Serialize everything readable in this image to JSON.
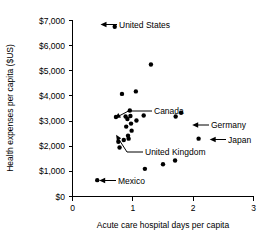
{
  "chart_data": {
    "type": "scatter",
    "title": "",
    "xlabel": "Acute care hospital days per capita",
    "ylabel": "Health expenses per capita ($US)",
    "xlim": [
      0,
      3
    ],
    "ylim": [
      0,
      7000
    ],
    "grid": false,
    "legend": "none",
    "xticks": [
      "0",
      "1",
      "2",
      "3"
    ],
    "xtick_values": [
      0,
      1,
      2,
      3
    ],
    "yticks": [
      "$0",
      "$1,000",
      "$2,000",
      "$3,000",
      "$4,000",
      "$5,000",
      "$6,000",
      "$7,000"
    ],
    "ytick_values": [
      0,
      1000,
      2000,
      3000,
      4000,
      5000,
      6000,
      7000
    ],
    "points": [
      {
        "x": 0.41,
        "y": 650,
        "label": "Mexico"
      },
      {
        "x": 0.7,
        "y": 6750,
        "label": "United States"
      },
      {
        "x": 0.72,
        "y": 3160,
        "label": ""
      },
      {
        "x": 0.76,
        "y": 2180,
        "label": ""
      },
      {
        "x": 0.78,
        "y": 1950,
        "label": ""
      },
      {
        "x": 0.82,
        "y": 4080,
        "label": ""
      },
      {
        "x": 0.85,
        "y": 2250,
        "label": ""
      },
      {
        "x": 0.88,
        "y": 3180,
        "label": ""
      },
      {
        "x": 0.89,
        "y": 2780,
        "label": ""
      },
      {
        "x": 0.91,
        "y": 3080,
        "label": ""
      },
      {
        "x": 0.92,
        "y": 2420,
        "label": ""
      },
      {
        "x": 0.93,
        "y": 2300,
        "label": ""
      },
      {
        "x": 0.95,
        "y": 3420,
        "label": "Canada"
      },
      {
        "x": 0.96,
        "y": 3200,
        "label": ""
      },
      {
        "x": 0.97,
        "y": 2900,
        "label": ""
      },
      {
        "x": 0.98,
        "y": 2620,
        "label": "United Kingdom"
      },
      {
        "x": 1.05,
        "y": 4180,
        "label": ""
      },
      {
        "x": 1.06,
        "y": 3020,
        "label": ""
      },
      {
        "x": 1.18,
        "y": 3220,
        "label": ""
      },
      {
        "x": 1.2,
        "y": 1100,
        "label": ""
      },
      {
        "x": 1.3,
        "y": 5250,
        "label": ""
      },
      {
        "x": 1.5,
        "y": 1280,
        "label": ""
      },
      {
        "x": 1.7,
        "y": 1430,
        "label": ""
      },
      {
        "x": 1.71,
        "y": 3180,
        "label": "Germany"
      },
      {
        "x": 1.8,
        "y": 3330,
        "label": ""
      },
      {
        "x": 2.09,
        "y": 2300,
        "label": "Japan"
      }
    ],
    "annotations": [
      {
        "name": "United States",
        "text": "United States",
        "point_x": 0.7,
        "point_y": 6750
      },
      {
        "name": "Canada",
        "text": "Canada",
        "point_x": 0.95,
        "point_y": 3420
      },
      {
        "name": "Germany",
        "text": "Germany",
        "point_x": 1.71,
        "point_y": 3180
      },
      {
        "name": "Japan",
        "text": "Japan",
        "point_x": 2.09,
        "point_y": 2300
      },
      {
        "name": "United Kingdom",
        "text": "United Kingdom",
        "point_x": 0.98,
        "point_y": 2620
      },
      {
        "name": "Mexico",
        "text": "Mexico",
        "point_x": 0.41,
        "point_y": 650
      }
    ],
    "colors": {
      "point": "#000000",
      "axis": "#000000",
      "text": "#000000",
      "background": "#ffffff"
    }
  },
  "labels": {
    "y_axis_title": "Health expenses per capita ($US)",
    "x_axis_title": "Acute care hospital days per capita",
    "y_tick_0": "$0",
    "y_tick_1": "$1,000",
    "y_tick_2": "$2,000",
    "y_tick_3": "$3,000",
    "y_tick_4": "$4,000",
    "y_tick_5": "$5,000",
    "y_tick_6": "$6,000",
    "y_tick_7": "$7,000",
    "x_tick_0": "0",
    "x_tick_1": "1",
    "x_tick_2": "2",
    "x_tick_3": "3",
    "annot_us": "United States",
    "annot_canada": "Canada",
    "annot_germany": "Germany",
    "annot_japan": "Japan",
    "annot_uk": "United Kingdom",
    "annot_mexico": "Mexico"
  }
}
